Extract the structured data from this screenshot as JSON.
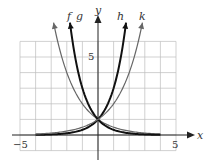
{
  "chart_data": {
    "type": "line",
    "title": "",
    "xlabel": "x",
    "ylabel": "y",
    "xlim": [
      -5,
      5
    ],
    "ylim": [
      -1,
      6
    ],
    "grid": true,
    "tick_labels": {
      "x_left": "−5",
      "x_right": "5",
      "y": "5"
    },
    "series": [
      {
        "name": "f",
        "description": "decreasing exponential (base ~1/2)",
        "color": "#666666",
        "width": 1.2,
        "base": 0.5
      },
      {
        "name": "g",
        "description": "decreasing exponential (base ~1/3)",
        "color": "#111111",
        "width": 2.0,
        "base": 0.3333
      },
      {
        "name": "h",
        "description": "increasing exponential (base ~3)",
        "color": "#111111",
        "width": 2.0,
        "base": 3
      },
      {
        "name": "k",
        "description": "increasing exponential (base ~2)",
        "color": "#666666",
        "width": 1.2,
        "base": 2
      }
    ],
    "common_point": [
      0,
      1
    ]
  },
  "labels": {
    "x_axis": "x",
    "y_axis": "y",
    "f": "f",
    "g": "g",
    "h": "h",
    "k": "k",
    "tick_neg5": "−5",
    "tick_5x": "5",
    "tick_5y": "5"
  }
}
